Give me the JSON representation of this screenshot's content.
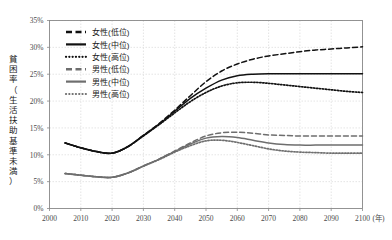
{
  "chart_data": {
    "type": "line",
    "title": "",
    "xlabel": "年",
    "ylabel": "貧困率（生活扶助基準未満）",
    "xlim": [
      2000,
      2100
    ],
    "ylim": [
      0,
      35
    ],
    "grid": true,
    "legend_position": "top-left-inside",
    "x_ticks": [
      "2000",
      "2010",
      "2020",
      "2030",
      "2040",
      "2050",
      "2060",
      "2070",
      "2080",
      "2090",
      "2100"
    ],
    "y_ticks": [
      "0%",
      "5%",
      "10%",
      "15%",
      "20%",
      "25%",
      "30%",
      "35%"
    ],
    "x": [
      2005,
      2010,
      2015,
      2020,
      2025,
      2030,
      2035,
      2040,
      2045,
      2050,
      2055,
      2060,
      2065,
      2070,
      2075,
      2080,
      2085,
      2090,
      2095,
      2100
    ],
    "series": [
      {
        "name": "女性(低位)",
        "style": "dashed",
        "color": "#111111",
        "values": [
          12.2,
          11.3,
          10.6,
          10.3,
          11.5,
          13.6,
          15.8,
          18.3,
          21.0,
          23.6,
          25.6,
          26.9,
          27.8,
          28.4,
          28.8,
          29.2,
          29.5,
          29.7,
          29.9,
          30.1
        ]
      },
      {
        "name": "女性(中位)",
        "style": "solid",
        "color": "#111111",
        "values": [
          12.2,
          11.3,
          10.6,
          10.3,
          11.5,
          13.6,
          15.7,
          18.1,
          20.5,
          22.4,
          23.9,
          24.7,
          25.0,
          25.1,
          25.1,
          25.1,
          25.1,
          25.1,
          25.1,
          25.1
        ]
      },
      {
        "name": "女性(高位)",
        "style": "dotted",
        "color": "#111111",
        "values": [
          12.2,
          11.3,
          10.6,
          10.3,
          11.5,
          13.5,
          15.6,
          17.8,
          19.9,
          21.6,
          22.8,
          23.4,
          23.5,
          23.3,
          23.0,
          22.7,
          22.4,
          22.1,
          21.8,
          21.6
        ]
      },
      {
        "name": "男性(低位)",
        "style": "dashed",
        "color": "#6e6e6e",
        "values": [
          6.5,
          6.2,
          5.9,
          5.8,
          6.6,
          7.9,
          9.2,
          10.7,
          12.2,
          13.5,
          14.1,
          14.2,
          14.0,
          13.7,
          13.6,
          13.5,
          13.5,
          13.5,
          13.5,
          13.5
        ]
      },
      {
        "name": "男性(中位)",
        "style": "solid",
        "color": "#6e6e6e",
        "values": [
          6.5,
          6.2,
          5.9,
          5.8,
          6.6,
          7.9,
          9.2,
          10.6,
          12.0,
          13.1,
          13.4,
          13.2,
          12.7,
          12.2,
          11.9,
          11.8,
          11.8,
          11.8,
          11.8,
          11.8
        ]
      },
      {
        "name": "男性(高位)",
        "style": "dotted",
        "color": "#6e6e6e",
        "values": [
          6.5,
          6.2,
          5.9,
          5.8,
          6.6,
          7.9,
          9.1,
          10.5,
          11.7,
          12.6,
          12.7,
          12.3,
          11.7,
          11.1,
          10.7,
          10.5,
          10.4,
          10.3,
          10.3,
          10.3
        ]
      }
    ]
  },
  "legend": {
    "items": [
      {
        "label": "女性(低位)"
      },
      {
        "label": "女性(中位)"
      },
      {
        "label": "女性(高位)"
      },
      {
        "label": "男性(低位)"
      },
      {
        "label": "男性(中位)"
      },
      {
        "label": "男性(高位)"
      }
    ]
  },
  "colors": {
    "female": "#111111",
    "male": "#6e6e6e",
    "grid": "#d9d9d9",
    "axis": "#888888",
    "text": "#4a4a4a"
  }
}
